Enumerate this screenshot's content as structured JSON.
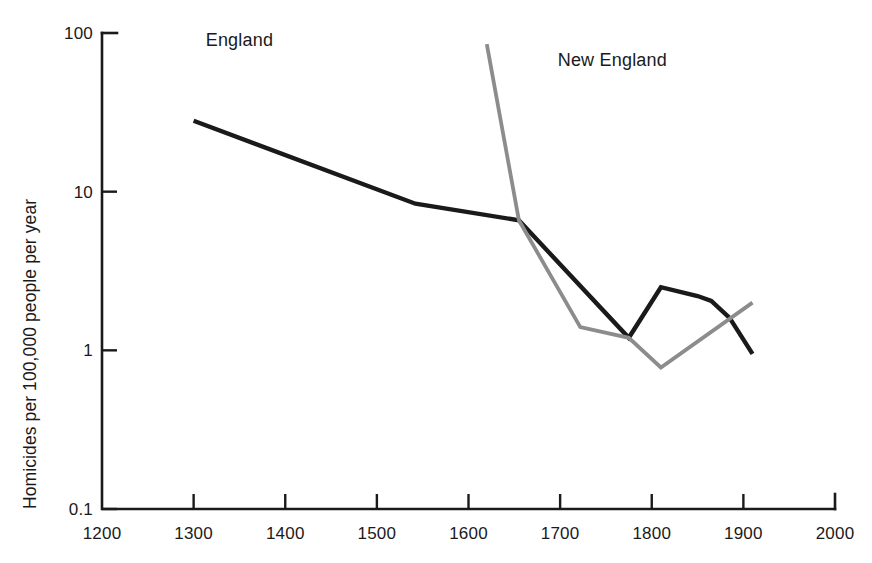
{
  "chart_data": {
    "type": "line",
    "title": "",
    "xlabel": "",
    "ylabel": "Homicides per 100,000 people per year",
    "xlim": [
      1200,
      2000
    ],
    "ylim": [
      0.1,
      100
    ],
    "yscale": "log",
    "grid": false,
    "legend_position": "inline-annotation",
    "xticks": [
      "1200",
      "1300",
      "1400",
      "1500",
      "1600",
      "1700",
      "1800",
      "1900",
      "2000"
    ],
    "xtick_values": [
      1200,
      1300,
      1400,
      1500,
      1600,
      1700,
      1800,
      1900,
      2000
    ],
    "yticks": [
      "100",
      "10",
      "1",
      "0.1"
    ],
    "ytick_values": [
      100,
      10,
      1,
      0.1
    ],
    "series": [
      {
        "name": "England",
        "color": "#1a1a1a",
        "label_x": 1350,
        "label_y": 46,
        "x": [
          1300,
          1542,
          1655,
          1775,
          1810,
          1850,
          1865,
          1885,
          1910
        ],
        "values": [
          28,
          8.4,
          6.6,
          1.2,
          2.5,
          2.2,
          2.05,
          1.6,
          0.95
        ]
      },
      {
        "name": "New England",
        "color": "#8c8c8c",
        "label_x": 1757,
        "label_y": 66,
        "x": [
          1620,
          1655,
          1722,
          1775,
          1810,
          1910
        ],
        "values": [
          85,
          6.6,
          1.4,
          1.2,
          0.78,
          2.0
        ]
      }
    ]
  }
}
